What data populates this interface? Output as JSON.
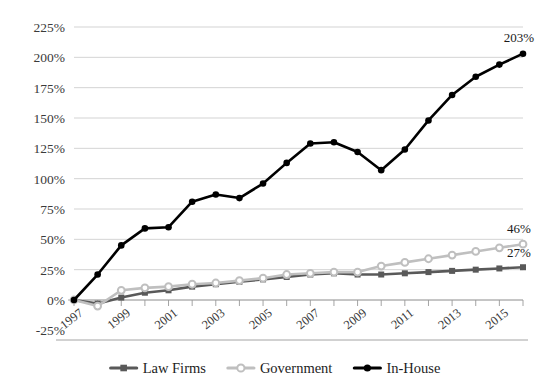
{
  "chart_data": {
    "type": "line",
    "title": "",
    "xlabel": "",
    "ylabel": "",
    "x": [
      1997,
      1998,
      1999,
      2000,
      2001,
      2002,
      2003,
      2004,
      2005,
      2006,
      2007,
      2008,
      2009,
      2010,
      2011,
      2012,
      2013,
      2014,
      2015,
      2016
    ],
    "tick_labels_x": [
      "1997",
      "1999",
      "2001",
      "2003",
      "2005",
      "2007",
      "2009",
      "2011",
      "2013",
      "2015"
    ],
    "tick_labels_y": [
      "225%",
      "200%",
      "175%",
      "150%",
      "125%",
      "100%",
      "75%",
      "50%",
      "25%",
      "0%",
      "-25%"
    ],
    "ylim": [
      -25,
      225
    ],
    "ytick_step": 25,
    "xlim": [
      1997,
      2016
    ],
    "grid": true,
    "legend_position": "bottom",
    "series": [
      {
        "name": "Law Firms",
        "color": "#595959",
        "marker": "filled-square",
        "end_label": "27%",
        "values": [
          0,
          -3,
          2,
          6,
          8,
          11,
          13,
          15,
          17,
          19,
          21,
          22,
          21,
          21,
          22,
          23,
          24,
          25,
          26,
          27
        ]
      },
      {
        "name": "Government",
        "color": "#bfbfbf",
        "marker": "open-circle",
        "end_label": "46%",
        "values": [
          0,
          -5,
          8,
          10,
          11,
          13,
          14,
          16,
          18,
          21,
          22,
          23,
          23,
          28,
          31,
          34,
          37,
          40,
          43,
          46
        ]
      },
      {
        "name": "In-House",
        "color": "#000000",
        "marker": "filled-circle",
        "end_label": "203%",
        "values": [
          0,
          21,
          45,
          59,
          60,
          81,
          87,
          84,
          96,
          113,
          129,
          130,
          122,
          107,
          124,
          148,
          169,
          184,
          194,
          203
        ]
      }
    ]
  },
  "legend": {
    "items": [
      {
        "label": "Law Firms"
      },
      {
        "label": "Government"
      },
      {
        "label": "In-House"
      }
    ]
  }
}
